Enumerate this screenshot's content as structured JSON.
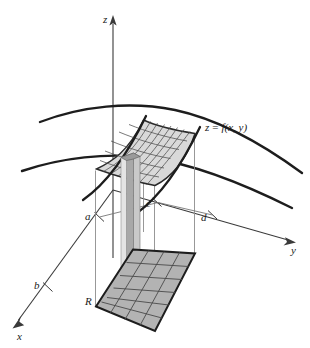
{
  "figure": {
    "background_color": "#ffffff",
    "width": 310,
    "height": 348
  },
  "axes": {
    "z": {
      "label": "z",
      "icon": "arrow-up-icon"
    },
    "y": {
      "label": "y",
      "icon": "arrow-right-icon"
    },
    "x": {
      "label": "x",
      "icon": "arrow-down-left-icon"
    },
    "origin": {
      "x": 113,
      "y": 190
    }
  },
  "bounds": {
    "a": {
      "label": "a",
      "axis": "x"
    },
    "b": {
      "label": "b",
      "axis": "x"
    },
    "c": {
      "label": "c",
      "axis": "y"
    },
    "d": {
      "label": "d",
      "axis": "y"
    }
  },
  "region": {
    "label": "R",
    "description": "rectangular base region in the xy-plane",
    "fill_color": "#b3b3b3",
    "grid_columns": 4,
    "grid_rows": 6
  },
  "surface": {
    "equation": "z = f(x, y)",
    "equation_z": "z",
    "equation_eq": "=",
    "equation_f": "f(x, y)",
    "patch_fill_color": "#d9d9d9",
    "curve_color": "#1d1d1d",
    "mesh_columns": 7,
    "mesh_rows": 6
  },
  "column": {
    "description": "representative vertical prism of height f(x,y) over a sub-rectangle of R",
    "side_color": "#a8a8a8",
    "front_color": "#c9c9c9",
    "highlight_color": "#e4e4e4"
  }
}
